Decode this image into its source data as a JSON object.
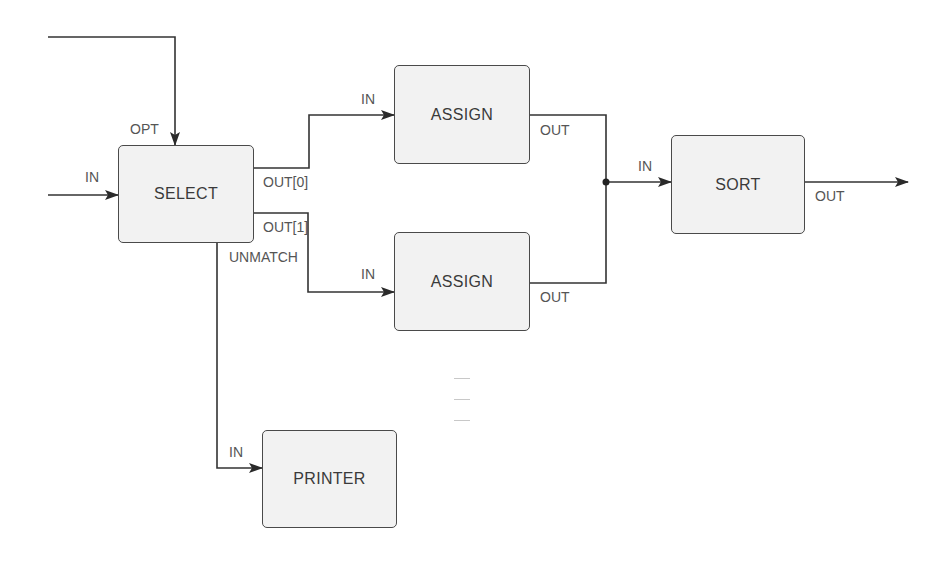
{
  "diagram": {
    "type": "dataflow",
    "nodes": [
      {
        "id": "select",
        "label": "SELECT",
        "x": 118,
        "y": 145,
        "w": 136,
        "h": 98
      },
      {
        "id": "assign1",
        "label": "ASSIGN",
        "x": 394,
        "y": 65,
        "w": 136,
        "h": 99
      },
      {
        "id": "assign2",
        "label": "ASSIGN",
        "x": 394,
        "y": 232,
        "w": 136,
        "h": 99
      },
      {
        "id": "sort",
        "label": "SORT",
        "x": 671,
        "y": 135,
        "w": 134,
        "h": 99
      },
      {
        "id": "printer",
        "label": "PRINTER",
        "x": 262,
        "y": 430,
        "w": 135,
        "h": 98
      }
    ],
    "ports": {
      "select_opt": "OPT",
      "select_in": "IN",
      "select_out0": "OUT[0]",
      "select_out1": "OUT[1]",
      "select_unmatch": "UNMATCH",
      "assign1_in": "IN",
      "assign1_out": "OUT",
      "assign2_in": "IN",
      "assign2_out": "OUT",
      "sort_in": "IN",
      "sort_out": "OUT",
      "printer_in": "IN"
    },
    "edges": [
      {
        "from": "external",
        "to": "select.OPT"
      },
      {
        "from": "external",
        "to": "select.IN"
      },
      {
        "from": "select.OUT[0]",
        "to": "assign1.IN"
      },
      {
        "from": "select.OUT[1]",
        "to": "assign2.IN"
      },
      {
        "from": "select.UNMATCH",
        "to": "printer.IN"
      },
      {
        "from": "assign1.OUT",
        "to": "sort.IN"
      },
      {
        "from": "assign2.OUT",
        "to": "sort.IN"
      },
      {
        "from": "sort.OUT",
        "to": "external"
      }
    ],
    "colors": {
      "line": "#333333",
      "box_fill": "#f2f2f2",
      "box_border": "#4a4a4a",
      "text": "#3a3a3a"
    }
  }
}
